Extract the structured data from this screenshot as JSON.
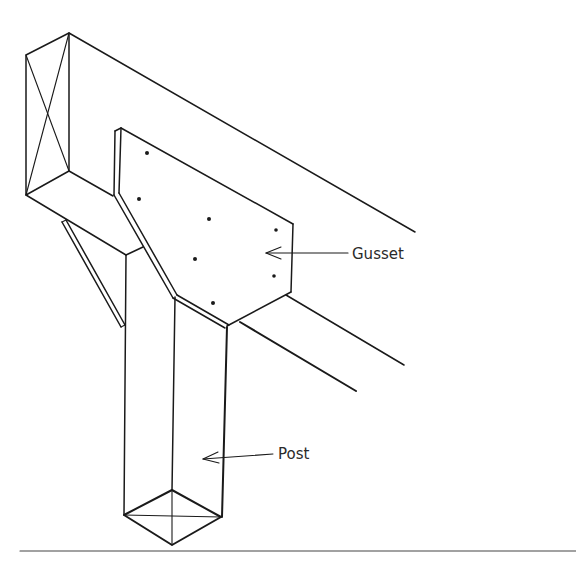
{
  "figure": {
    "type": "isometric line drawing",
    "labels": [
      {
        "id": "gusset",
        "text": "Gusset"
      },
      {
        "id": "post",
        "text": "Post"
      }
    ],
    "components": [
      "beam",
      "gusset plate",
      "post",
      "knee brace",
      "bolts"
    ],
    "bolt_count": 8,
    "colors": {
      "line": "#1a1a1a",
      "background": "#ffffff"
    }
  }
}
